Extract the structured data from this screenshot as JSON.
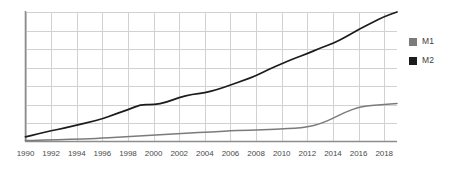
{
  "chart_data": {
    "type": "line",
    "title": "",
    "subtitle": "",
    "xlabel": "",
    "ylabel": "",
    "grid": true,
    "legend_position": "right",
    "xlim": [
      1990,
      2019
    ],
    "ylim": [
      0,
      7
    ],
    "x": [
      1990,
      1991,
      1992,
      1993,
      1994,
      1995,
      1996,
      1997,
      1998,
      1999,
      2000,
      2001,
      2002,
      2003,
      2004,
      2005,
      2006,
      2007,
      2008,
      2009,
      2010,
      2011,
      2012,
      2013,
      2014,
      2015,
      2016,
      2017,
      2018,
      2019
    ],
    "xtick_labels": [
      "1990",
      "1992",
      "1994",
      "1996",
      "1998",
      "2000",
      "2002",
      "2004",
      "2006",
      "2008",
      "2010",
      "2012",
      "2014",
      "2016",
      "2018"
    ],
    "xticks": [
      1990,
      1992,
      1994,
      1996,
      1998,
      2000,
      2002,
      2004,
      2006,
      2008,
      2010,
      2012,
      2014,
      2016,
      2018
    ],
    "series": [
      {
        "name": "M1",
        "color": "#7b7b7b",
        "values": [
          0.05,
          0.07,
          0.09,
          0.11,
          0.13,
          0.15,
          0.18,
          0.22,
          0.26,
          0.3,
          0.34,
          0.38,
          0.42,
          0.46,
          0.5,
          0.54,
          0.58,
          0.6,
          0.62,
          0.64,
          0.68,
          0.72,
          0.78,
          0.95,
          1.25,
          1.6,
          1.85,
          1.95,
          2.0,
          2.05
        ]
      },
      {
        "name": "M2",
        "color": "#1c1c1c",
        "values": [
          0.25,
          0.42,
          0.58,
          0.72,
          0.88,
          1.05,
          1.22,
          1.48,
          1.72,
          2.0,
          1.98,
          2.12,
          2.38,
          2.55,
          2.62,
          2.82,
          3.05,
          3.3,
          3.55,
          3.9,
          4.2,
          4.5,
          4.75,
          5.05,
          5.3,
          5.65,
          6.05,
          6.4,
          6.75,
          7.0
        ]
      }
    ]
  },
  "legend": {
    "items": [
      {
        "label": "M1",
        "color": "#7b7b7b"
      },
      {
        "label": "M2",
        "color": "#1c1c1c"
      }
    ]
  },
  "axis": {
    "axis_color": "#8d8d8d",
    "grid_color": "#d2d2d2"
  }
}
